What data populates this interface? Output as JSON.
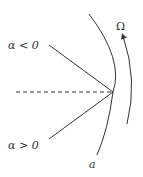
{
  "diagram": {
    "labels": {
      "alpha_negative": "α < 0",
      "alpha_positive": "α > 0",
      "omega": "Ω",
      "radius": "a"
    },
    "colors": {
      "stroke": "#333333",
      "background": "#ffffff"
    },
    "elements": [
      {
        "type": "line",
        "name": "upper-ray",
        "label_ref": "alpha_negative"
      },
      {
        "type": "line",
        "name": "lower-ray",
        "label_ref": "alpha_positive"
      },
      {
        "type": "dashed-line",
        "name": "horizontal-axis"
      },
      {
        "type": "arc",
        "name": "surface-arc",
        "label_ref": "radius"
      },
      {
        "type": "arc-arrow",
        "name": "rotation-arrow",
        "label_ref": "omega"
      }
    ]
  }
}
